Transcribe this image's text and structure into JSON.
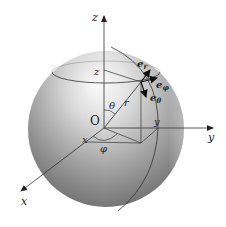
{
  "diagram": {
    "title": "",
    "type": "spherical-coordinates",
    "axes": {
      "z": "z",
      "y": "y",
      "x": "x"
    },
    "origin_label": "O",
    "point_labels": {
      "z_projection": "z",
      "y_projection": "y",
      "x_projection": "x"
    },
    "angles": {
      "polar": "θ",
      "azimuth": "φ"
    },
    "radius_label": "r",
    "unit_vectors": {
      "e_r": {
        "base": "e",
        "sub": "r"
      },
      "e_phi": {
        "base": "e",
        "sub": "φ"
      },
      "e_theta": {
        "base": "e",
        "sub": "θ"
      }
    },
    "colors": {
      "sphere_light": "#ffffff",
      "sphere_mid": "#b8b8b8",
      "sphere_dark": "#6e6e6e",
      "lines": "#333333"
    }
  }
}
